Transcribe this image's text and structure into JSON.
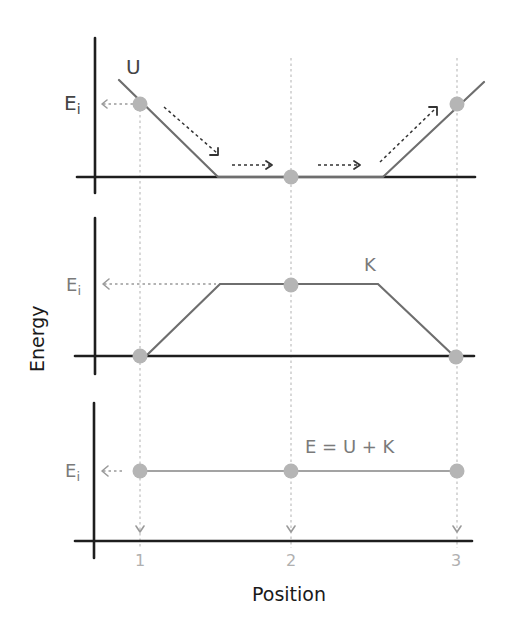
{
  "diagram": {
    "type": "energy-conservation-panels",
    "x_axis_label": "Position",
    "y_axis_label": "Energy",
    "x_ticks": [
      "1",
      "2",
      "3"
    ],
    "energy_level_label": "Ei",
    "energy_level_label_main": "E",
    "energy_level_label_sub": "i",
    "colors": {
      "axis": "#1e1e1e",
      "curve": "#6e6e6e",
      "dot": "#b5b5b5",
      "guide": "#c4c4c4"
    },
    "panels": [
      {
        "id": "potential",
        "curve_label": "U",
        "description": "Potential energy: starts at Ei at position 1, drops to 0, flat through position 2, rises back to Ei at position 3",
        "values_at_positions": {
          "1": "Ei",
          "2": "0",
          "3": "Ei"
        }
      },
      {
        "id": "kinetic",
        "curve_label": "K",
        "description": "Kinetic energy: 0 at position 1, rises to Ei plateau through position 2, falls back to 0 at position 3",
        "values_at_positions": {
          "1": "0",
          "2": "Ei",
          "3": "0"
        }
      },
      {
        "id": "total",
        "curve_label": "E = U + K",
        "description": "Total mechanical energy constant at Ei",
        "values_at_positions": {
          "1": "Ei",
          "2": "Ei",
          "3": "Ei"
        }
      }
    ]
  }
}
